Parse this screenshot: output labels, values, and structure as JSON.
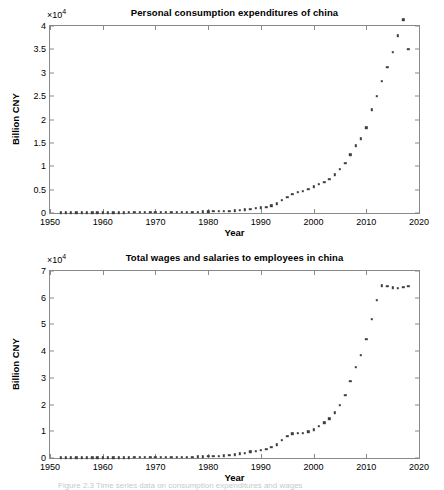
{
  "figure": {
    "caption": "Figure 2.3   Time series data on consumption expenditures and wages"
  },
  "chart_data": [
    {
      "type": "scatter",
      "title": "Personal consumption expenditures of china",
      "xlabel": "Year",
      "ylabel": "Billion CNY",
      "y_exponent": "×10",
      "y_exponent_power": "4",
      "xlim": [
        1950,
        2020
      ],
      "ylim": [
        0,
        40000
      ],
      "xticks": [
        1950,
        1960,
        1970,
        1980,
        1990,
        2000,
        2010,
        2020
      ],
      "yticks": [
        0,
        0.5,
        1,
        1.5,
        2,
        2.5,
        3,
        3.5,
        4
      ],
      "ytick_labels": [
        "0",
        "0.5",
        "1",
        "1.5",
        "2",
        "2.5",
        "3",
        "3.5",
        "4"
      ],
      "ytick_values": [
        0,
        5000,
        10000,
        15000,
        20000,
        25000,
        30000,
        35000,
        40000
      ],
      "grid": false,
      "legend": null,
      "marker": "square",
      "marker_color": "#3d3d3d",
      "x": [
        1952,
        1953,
        1954,
        1955,
        1956,
        1957,
        1958,
        1959,
        1960,
        1961,
        1962,
        1963,
        1964,
        1965,
        1966,
        1967,
        1968,
        1969,
        1970,
        1971,
        1972,
        1973,
        1974,
        1975,
        1976,
        1977,
        1978,
        1979,
        1980,
        1981,
        1982,
        1983,
        1984,
        1985,
        1986,
        1987,
        1988,
        1989,
        1990,
        1991,
        1992,
        1993,
        1994,
        1995,
        1996,
        1997,
        1998,
        1999,
        2000,
        2001,
        2002,
        2003,
        2004,
        2005,
        2006,
        2007,
        2008,
        2009,
        2010,
        2011,
        2012,
        2013,
        2014,
        2015,
        2016,
        2017,
        2018
      ],
      "values": [
        48,
        53,
        57,
        61,
        66,
        70,
        72,
        76,
        83,
        93,
        95,
        97,
        103,
        113,
        120,
        124,
        127,
        134,
        141,
        148,
        158,
        168,
        174,
        182,
        190,
        200,
        222,
        256,
        294,
        325,
        348,
        379,
        427,
        528,
        601,
        687,
        856,
        1016,
        1145,
        1303,
        1565,
        1986,
        2680,
        3387,
        4032,
        4426,
        4703,
        5106,
        5642,
        6105,
        6646,
        7189,
        8186,
        9367,
        10620,
        12508,
        14430,
        15893,
        18244,
        22131,
        25050,
        28136,
        31212,
        34440,
        37940,
        41362,
        35100
      ],
      "x_first_point": 1952,
      "x_last_point": 2018,
      "value_last_point": 35100
    },
    {
      "type": "scatter",
      "title": "Total wages and salaries to employees in china",
      "xlabel": "Year",
      "ylabel": "Billion CNY",
      "y_exponent": "×10",
      "y_exponent_power": "4",
      "xlim": [
        1950,
        2020
      ],
      "ylim": [
        0,
        70000
      ],
      "xticks": [
        1950,
        1960,
        1970,
        1980,
        1990,
        2000,
        2010,
        2020
      ],
      "yticks": [
        0,
        1,
        2,
        3,
        4,
        5,
        6,
        7
      ],
      "ytick_labels": [
        "0",
        "1",
        "2",
        "3",
        "4",
        "5",
        "6",
        "7"
      ],
      "ytick_values": [
        0,
        10000,
        20000,
        30000,
        40000,
        50000,
        60000,
        70000
      ],
      "grid": false,
      "legend": null,
      "marker": "square",
      "marker_color": "#3d3d3d",
      "x": [
        1952,
        1953,
        1954,
        1955,
        1956,
        1957,
        1958,
        1959,
        1960,
        1961,
        1962,
        1963,
        1964,
        1965,
        1966,
        1967,
        1968,
        1969,
        1970,
        1971,
        1972,
        1973,
        1974,
        1975,
        1976,
        1977,
        1978,
        1979,
        1980,
        1981,
        1982,
        1983,
        1984,
        1985,
        1986,
        1987,
        1988,
        1989,
        1990,
        1991,
        1992,
        1993,
        1994,
        1995,
        1996,
        1997,
        1998,
        1999,
        2000,
        2001,
        2002,
        2003,
        2004,
        2005,
        2006,
        2007,
        2008,
        2009,
        2010,
        2011,
        2012,
        2013,
        2014,
        2015,
        2016,
        2017,
        2018
      ],
      "values": [
        68,
        78,
        86,
        93,
        120,
        130,
        160,
        180,
        190,
        160,
        150,
        160,
        175,
        190,
        205,
        210,
        215,
        225,
        240,
        260,
        290,
        310,
        325,
        345,
        360,
        380,
        450,
        530,
        630,
        700,
        760,
        830,
        1020,
        1300,
        1580,
        1810,
        2320,
        2620,
        2950,
        3320,
        3940,
        4920,
        6650,
        8100,
        9080,
        9405,
        9296,
        9875,
        10656,
        11831,
        13161,
        14744,
        16901,
        19831,
        23439,
        28674,
        34093,
        38450,
        44400,
        52000,
        59000,
        64500,
        64300,
        63800,
        63500,
        64000,
        64300
      ],
      "x_first_point": 1952,
      "x_last_point": 2018,
      "value_last_point": 64300
    }
  ]
}
